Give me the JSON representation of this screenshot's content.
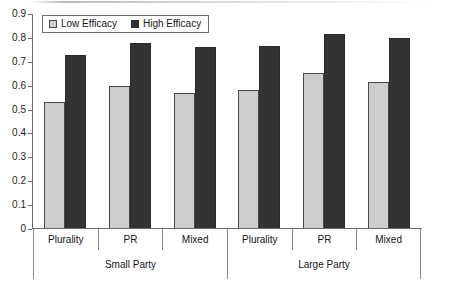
{
  "chart_data": {
    "type": "bar",
    "title": "",
    "xlabel": "",
    "ylabel": "",
    "ylim": [
      0,
      0.9
    ],
    "grid": false,
    "legend_position": "top-left",
    "y_ticks": [
      "0",
      "0.1",
      "0.2",
      "0.3",
      "0.4",
      "0.5",
      "0.6",
      "0.7",
      "0.8",
      "0.9"
    ],
    "y_tick_values": [
      0,
      0.1,
      0.2,
      0.3,
      0.4,
      0.5,
      0.6,
      0.7,
      0.8,
      0.9
    ],
    "categories": [
      "Plurality",
      "PR",
      "Mixed",
      "Plurality",
      "PR",
      "Mixed"
    ],
    "groups": [
      {
        "label": "Small Party",
        "categories": [
          "Plurality",
          "PR",
          "Mixed"
        ]
      },
      {
        "label": "Large Party",
        "categories": [
          "Plurality",
          "PR",
          "Mixed"
        ]
      }
    ],
    "series": [
      {
        "name": "Low Efficacy",
        "color": "#cdcdcd",
        "values": [
          0.53,
          0.6,
          0.57,
          0.58,
          0.655,
          0.615
        ]
      },
      {
        "name": "High Efficacy",
        "color": "#333333",
        "values": [
          0.73,
          0.78,
          0.76,
          0.765,
          0.815,
          0.8
        ]
      }
    ]
  },
  "legend": {
    "items": [
      {
        "label": "Low Efficacy",
        "swatch": "low-efficacy-swatch"
      },
      {
        "label": "High Efficacy",
        "swatch": "high-efficacy-swatch"
      }
    ]
  }
}
